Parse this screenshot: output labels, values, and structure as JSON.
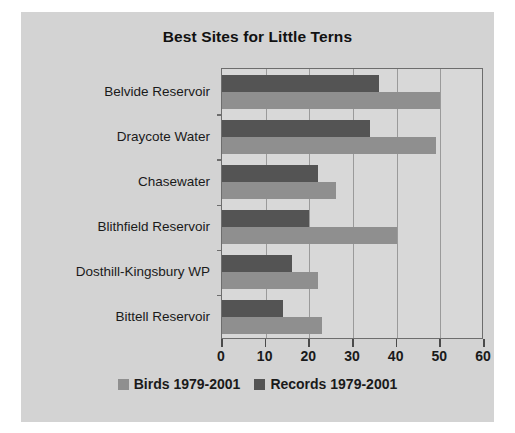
{
  "chart_data": {
    "type": "bar",
    "orientation": "horizontal",
    "title": "Best Sites for Little Terns",
    "xlabel": "",
    "ylabel": "",
    "xlim": [
      0,
      60
    ],
    "xticks": [
      "0",
      "10",
      "20",
      "30",
      "40",
      "50",
      "60"
    ],
    "grid": true,
    "legend_position": "bottom",
    "categories": [
      "Belvide Reservoir",
      "Draycote Water",
      "Chasewater",
      "Blithfield Reservoir",
      "Dosthill-Kingsbury WP",
      "Bittell Reservoir"
    ],
    "series": [
      {
        "name": "Birds 1979-2001",
        "color": "#8f8f8f",
        "values": [
          50,
          49,
          26,
          40,
          22,
          23
        ]
      },
      {
        "name": "Records 1979-2001",
        "color": "#545454",
        "values": [
          36,
          34,
          22,
          20,
          16,
          14
        ]
      }
    ]
  },
  "style": {
    "background": "#d3d3d3",
    "plot_background": "#d8d8d8",
    "axis_color": "#6d6d6d",
    "grid_color": "#9a9a9a",
    "text_color": "#1a1a1a"
  }
}
